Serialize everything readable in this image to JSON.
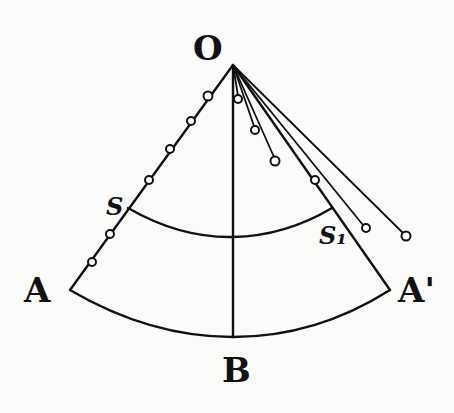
{
  "figure": {
    "labels": {
      "apex": "O",
      "left_corner": "A",
      "right_corner": "A'",
      "bottom": "B",
      "left_intersection": "S",
      "right_intersection": "S₁"
    },
    "colors": {
      "ink": "#111111",
      "paper": "#fbfbfa"
    },
    "apex_point": [
      233,
      65
    ],
    "left_edge": {
      "from": "O",
      "to": "A",
      "bead_count": 6
    },
    "pendulums_right": [
      {
        "end": [
          238,
          99
        ]
      },
      {
        "end": [
          255,
          130
        ]
      },
      {
        "end": [
          275,
          161
        ]
      },
      {
        "end": [
          366,
          228
        ],
        "bead": [
          315,
          180
        ]
      },
      {
        "end": [
          406,
          236
        ]
      }
    ]
  }
}
